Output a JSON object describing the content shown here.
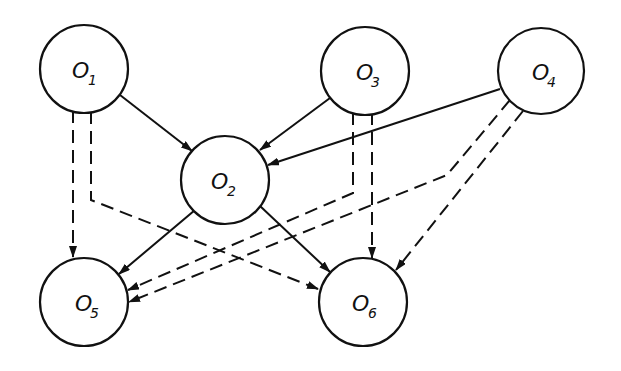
{
  "diagram": {
    "nodes": [
      {
        "id": "o1",
        "letter": "O",
        "sub": "1",
        "cx": 84,
        "cy": 69,
        "r": 44
      },
      {
        "id": "o2",
        "letter": "O",
        "sub": "2",
        "cx": 225,
        "cy": 180,
        "r": 44
      },
      {
        "id": "o3",
        "letter": "O",
        "sub": "3",
        "cx": 365,
        "cy": 71,
        "r": 44
      },
      {
        "id": "o4",
        "letter": "O",
        "sub": "4",
        "cx": 541,
        "cy": 71,
        "r": 43
      },
      {
        "id": "o5",
        "letter": "O",
        "sub": "5",
        "cx": 84,
        "cy": 302,
        "r": 44
      },
      {
        "id": "o6",
        "letter": "O",
        "sub": "6",
        "cx": 363,
        "cy": 302,
        "r": 44
      }
    ],
    "edges": [
      {
        "from": "O1",
        "to": "O2",
        "style": "solid"
      },
      {
        "from": "O3",
        "to": "O2",
        "style": "solid"
      },
      {
        "from": "O4",
        "to": "O2",
        "style": "solid"
      },
      {
        "from": "O2",
        "to": "O5",
        "style": "solid"
      },
      {
        "from": "O2",
        "to": "O6",
        "style": "solid"
      },
      {
        "from": "O1",
        "to": "O5",
        "style": "dashed"
      },
      {
        "from": "O1",
        "to": "O6",
        "style": "dashed"
      },
      {
        "from": "O3",
        "to": "O5",
        "style": "dashed"
      },
      {
        "from": "O3",
        "to": "O6",
        "style": "dashed"
      },
      {
        "from": "O4",
        "to": "O5",
        "style": "dashed"
      },
      {
        "from": "O4",
        "to": "O6",
        "style": "dashed"
      }
    ]
  }
}
